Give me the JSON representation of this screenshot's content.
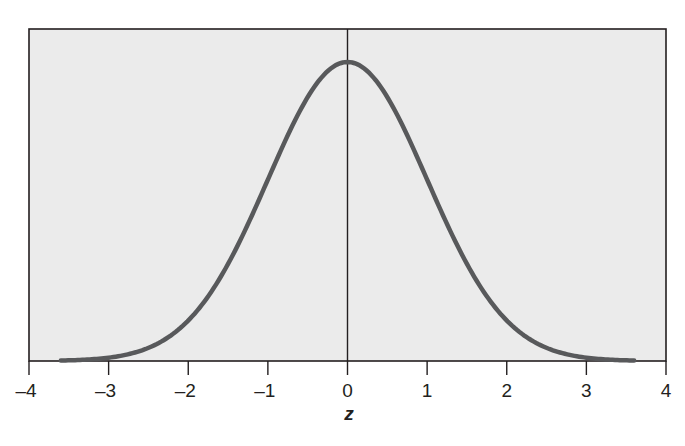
{
  "chart_data": {
    "type": "line",
    "title": "",
    "xlabel": "z",
    "ylabel": "",
    "xlim": [
      -4,
      4
    ],
    "x_ticks": [
      -4,
      -3,
      -2,
      -1,
      0,
      1,
      2,
      3,
      4
    ],
    "x_tick_labels": [
      "–4",
      "–3",
      "–2",
      "–1",
      "0",
      "1",
      "2",
      "3",
      "4"
    ],
    "grid": false,
    "legend": null,
    "series": [
      {
        "name": "Standard normal density",
        "x_range": [
          -3.6,
          3.6
        ],
        "x": [
          -3.6,
          -3,
          -2.5,
          -2,
          -1.5,
          -1,
          -0.5,
          0,
          0.5,
          1,
          1.5,
          2,
          2.5,
          3,
          3.6
        ],
        "y": [
          0.0006,
          0.0044,
          0.0175,
          0.054,
          0.1295,
          0.242,
          0.3521,
          0.3989,
          0.3521,
          0.242,
          0.1295,
          0.054,
          0.0175,
          0.0044,
          0.0006
        ]
      }
    ],
    "vertical_reference_line": {
      "x": 0
    },
    "colors": {
      "plot_background": "#ebebeb",
      "curve": "#58595b",
      "axes": "#231f20"
    }
  }
}
